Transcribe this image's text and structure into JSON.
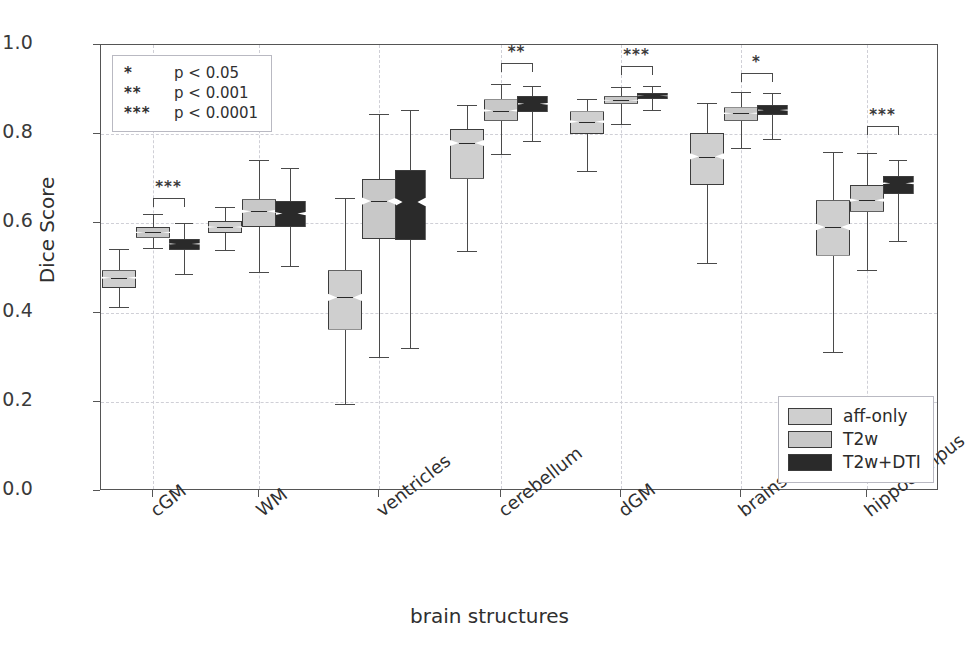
{
  "chart_data": {
    "type": "box",
    "title": "",
    "xlabel": "brain structures",
    "ylabel": "Dice Score",
    "ylim": [
      0.0,
      1.0
    ],
    "yticks": [
      "0.0",
      "0.2",
      "0.4",
      "0.6",
      "0.8",
      "1.0"
    ],
    "ytick_values": [
      0.0,
      0.2,
      0.4,
      0.6,
      0.8,
      1.0
    ],
    "grid": true,
    "legend_position": "lower right",
    "categories": [
      "cGM",
      "WM",
      "ventricles",
      "cerebellum",
      "dGM",
      "brainstem",
      "hippocampus"
    ],
    "series": [
      {
        "name": "aff-only",
        "color": "#cfcfcf",
        "boxes": [
          {
            "category": "cGM",
            "whisker_low": 0.412,
            "q1": 0.455,
            "median": 0.478,
            "q3": 0.495,
            "whisker_high": 0.543
          },
          {
            "category": "WM",
            "whisker_low": 0.54,
            "q1": 0.578,
            "median": 0.592,
            "q3": 0.606,
            "whisker_high": 0.637
          },
          {
            "category": "ventricles",
            "whisker_low": 0.194,
            "q1": 0.362,
            "median": 0.434,
            "q3": 0.495,
            "whisker_high": 0.657
          },
          {
            "category": "cerebellum",
            "whisker_low": 0.538,
            "q1": 0.7,
            "median": 0.78,
            "q3": 0.812,
            "whisker_high": 0.866
          },
          {
            "category": "dGM",
            "whisker_low": 0.717,
            "q1": 0.8,
            "median": 0.828,
            "q3": 0.851,
            "whisker_high": 0.88
          },
          {
            "category": "brainstem",
            "whisker_low": 0.512,
            "q1": 0.686,
            "median": 0.75,
            "q3": 0.803,
            "whisker_high": 0.87
          },
          {
            "category": "hippocampus",
            "whisker_low": 0.312,
            "q1": 0.528,
            "median": 0.592,
            "q3": 0.652,
            "whisker_high": 0.76
          }
        ]
      },
      {
        "name": "T2w",
        "color": "#c8c8c8",
        "boxes": [
          {
            "category": "cGM",
            "whisker_low": 0.545,
            "q1": 0.568,
            "median": 0.58,
            "q3": 0.592,
            "whisker_high": 0.62
          },
          {
            "category": "WM",
            "whisker_low": 0.49,
            "q1": 0.592,
            "median": 0.627,
            "q3": 0.654,
            "whisker_high": 0.742
          },
          {
            "category": "ventricles",
            "whisker_low": 0.3,
            "q1": 0.565,
            "median": 0.65,
            "q3": 0.7,
            "whisker_high": 0.846
          },
          {
            "category": "cerebellum",
            "whisker_low": 0.755,
            "q1": 0.83,
            "median": 0.853,
            "q3": 0.878,
            "whisker_high": 0.913
          },
          {
            "category": "dGM",
            "whisker_low": 0.823,
            "q1": 0.868,
            "median": 0.876,
            "q3": 0.885,
            "whisker_high": 0.905
          },
          {
            "category": "brainstem",
            "whisker_low": 0.77,
            "q1": 0.83,
            "median": 0.847,
            "q3": 0.86,
            "whisker_high": 0.895
          },
          {
            "category": "hippocampus",
            "whisker_low": 0.495,
            "q1": 0.626,
            "median": 0.652,
            "q3": 0.686,
            "whisker_high": 0.757
          }
        ]
      },
      {
        "name": "T2w+DTI",
        "color": "#2a2a2a",
        "boxes": [
          {
            "category": "cGM",
            "whisker_low": 0.487,
            "q1": 0.541,
            "median": 0.554,
            "q3": 0.566,
            "whisker_high": 0.6
          },
          {
            "category": "WM",
            "whisker_low": 0.505,
            "q1": 0.592,
            "median": 0.622,
            "q3": 0.65,
            "whisker_high": 0.725
          },
          {
            "category": "ventricles",
            "whisker_low": 0.32,
            "q1": 0.562,
            "median": 0.648,
            "q3": 0.72,
            "whisker_high": 0.855
          },
          {
            "category": "cerebellum",
            "whisker_low": 0.785,
            "q1": 0.85,
            "median": 0.868,
            "q3": 0.886,
            "whisker_high": 0.908
          },
          {
            "category": "dGM",
            "whisker_low": 0.855,
            "q1": 0.879,
            "median": 0.886,
            "q3": 0.893,
            "whisker_high": 0.907
          },
          {
            "category": "brainstem",
            "whisker_low": 0.79,
            "q1": 0.843,
            "median": 0.854,
            "q3": 0.866,
            "whisker_high": 0.892
          },
          {
            "category": "hippocampus",
            "whisker_low": 0.56,
            "q1": 0.665,
            "median": 0.69,
            "q3": 0.707,
            "whisker_high": 0.742
          }
        ]
      }
    ],
    "significance": [
      {
        "category": "cGM",
        "label": "***",
        "y": 0.658
      },
      {
        "category": "cerebellum",
        "label": "**",
        "y": 0.96
      },
      {
        "category": "dGM",
        "label": "***",
        "y": 0.952
      },
      {
        "category": "brainstem",
        "label": "*",
        "y": 0.938
      },
      {
        "category": "hippocampus",
        "label": "***",
        "y": 0.818
      }
    ],
    "pvalue_legend": [
      {
        "symbol": "*",
        "text": "p < 0.05"
      },
      {
        "symbol": "**",
        "text": "p < 0.001"
      },
      {
        "symbol": "***",
        "text": "p < 0.0001"
      }
    ]
  }
}
